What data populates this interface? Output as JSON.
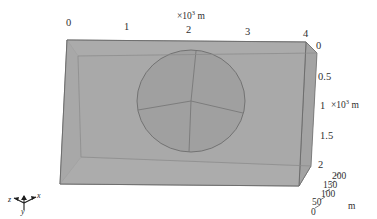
{
  "figure": {
    "kind": "3d-block-model-with-embedded-sphere",
    "colors": {
      "front_face": "#a9a9a9",
      "top_face": "#b4b4b4",
      "left_end_face": "#9d9d9d",
      "right_end_face": "#a2a2a2",
      "bottom_face": "#b8b8b8",
      "sphere_fill": "#9e9e9e",
      "edge_stroke": "#6e6e6e",
      "inner_edge_stroke": "#7a7a7a",
      "background": "#ffffff",
      "text": "#2f2f2f"
    }
  },
  "axes": {
    "top": {
      "name": "x-axis",
      "unit_label": "×10",
      "unit_exponent": "3",
      "unit_suffix": " m",
      "ticks": [
        "0",
        "1",
        "2",
        "3",
        "4"
      ]
    },
    "right": {
      "name": "y-axis",
      "unit_label": "×10",
      "unit_exponent": "3",
      "unit_suffix": " m",
      "ticks": [
        "0",
        "0.5",
        "1",
        "1.5",
        "2"
      ],
      "unit_attached_to_tick": "1"
    },
    "depth": {
      "name": "z-axis",
      "unit_suffix": "m",
      "ticks": [
        "0",
        "50",
        "100",
        "150",
        "200"
      ]
    }
  },
  "triad": {
    "name": "orientation-axis-triad",
    "x_label": "x",
    "y_label": "y",
    "z_label": "z"
  }
}
